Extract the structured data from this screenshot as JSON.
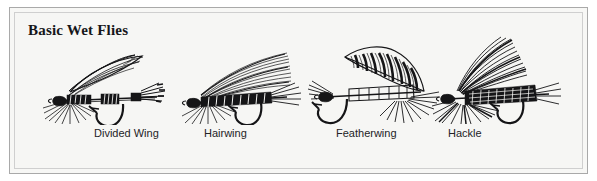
{
  "figure": {
    "title": "Basic Wet Flies",
    "background_color": "#f6f6f4",
    "page_color": "#ffffff",
    "border_outer_color": "#a9a9a9",
    "border_inner_color": "#cfcfcf",
    "ink_color": "#151517"
  },
  "flies": [
    {
      "label": "Divided Wing",
      "icon": "wet-fly-divided-wing-illustration",
      "description": "Two separate quill wing slips swept back over a ribbed body with a soft hackle collar and tail fibers."
    },
    {
      "label": "Hairwing",
      "icon": "wet-fly-hairwing-illustration",
      "description": "A wing of fine animal hair strands lying over a segmented body with a sparse throat hackle."
    },
    {
      "label": "Featherwing",
      "icon": "wet-fly-featherwing-illustration",
      "description": "A single barred feather wing over a smooth ribbed body with a swept throat hackle."
    },
    {
      "label": "Hackle",
      "icon": "wet-fly-hackle-illustration",
      "description": "A dense collar of radiating hackle fibers surrounding a dark dubbed body, no separate wing."
    }
  ]
}
